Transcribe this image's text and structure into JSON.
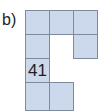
{
  "figure": {
    "part_label": "b)",
    "colors": {
      "cell_fill": "#ccd9ec",
      "cell_border": "#7e8b9c",
      "text": "#231f20",
      "background": "#ffffff"
    },
    "grid": {
      "columns": 3,
      "rows": 4,
      "cell_width": 25,
      "cell_height": 25,
      "origin_x": 25,
      "origin_y": 10
    },
    "cells": [
      {
        "name": "cell-r1c1",
        "row": 1,
        "col": 1,
        "filled": true,
        "text": ""
      },
      {
        "name": "cell-r1c2",
        "row": 1,
        "col": 2,
        "filled": true,
        "text": ""
      },
      {
        "name": "cell-r1c3",
        "row": 1,
        "col": 3,
        "filled": true,
        "text": ""
      },
      {
        "name": "cell-r2c1",
        "row": 2,
        "col": 1,
        "filled": true,
        "text": ""
      },
      {
        "name": "cell-r2c3",
        "row": 2,
        "col": 3,
        "filled": true,
        "text": ""
      },
      {
        "name": "cell-r3c1",
        "row": 3,
        "col": 1,
        "filled": true,
        "text": "41"
      },
      {
        "name": "cell-r4c1",
        "row": 4,
        "col": 1,
        "filled": true,
        "text": ""
      },
      {
        "name": "cell-r4c2",
        "row": 4,
        "col": 2,
        "filled": true,
        "text": ""
      }
    ]
  }
}
